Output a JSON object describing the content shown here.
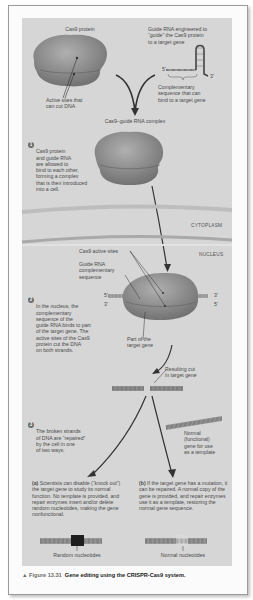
{
  "figure": {
    "number_label": "▲ Figure 13.31",
    "title": "Gene editing using the CRISPR-Cas9 system."
  },
  "top": {
    "cas9_label": "Cas9 protein",
    "active_sites_label": "Active sites that\ncan cut DNA",
    "guide_rna_label": "Guide RNA engineered to\n“guide” the Cas9 protein\nto a target gene",
    "complementary_label": "Complementary\nsequence that can\nbind to a target gene",
    "five_prime": "5'",
    "three_prime": "3'",
    "complex_label": "Cas9–guide RNA complex"
  },
  "steps": [
    {
      "number": "1",
      "text": "Cas9 protein\nand guide RNA\nare allowed to\nbind to each other,\nforming a complex\nthat is then introduced\ninto a cell."
    },
    {
      "number": "2",
      "text": "In the nucleus, the\ncomplementary\nsequence of the\nguide RNA binds to part\nof the target gene. The\nactive sites of the Cas9\nprotein cut the DNA\non both strands."
    },
    {
      "number": "3",
      "text": "The broken strands\nof DNA are “repaired”\nby the cell in one\nof two ways:"
    }
  ],
  "regions": {
    "cytoplasm": "CYTOPLASM",
    "nucleus": "NUCLEUS"
  },
  "nucleus": {
    "active_sites_label": "Cas9 active sites",
    "guide_complementary_label": "Guide RNA\ncomplementary\nsequence",
    "target_part_label": "Part of the\ntarget gene",
    "left_top": "5'",
    "left_bottom": "3'",
    "right_top": "3'",
    "right_bottom": "5'"
  },
  "cut": {
    "resulting_cut_label": "Resulting cut\nin target gene",
    "normal_gene_label": "Normal\n(functional)\ngene for use\nas a template"
  },
  "outcomes": [
    {
      "label": "(a)",
      "text": " Scientists can disable (“knock out”) the target gene to study its normal function. No template is provided, and repair enzymes insert and/or delete random nucleotides, making the gene nonfunctional.",
      "dna_label": "Random nucleotides"
    },
    {
      "label": "(b)",
      "text": " If the target gene has a mutation, it can be repaired. A normal copy of the gene is provided, and repair enzymes use it as a template, restoring the normal gene sequence.",
      "dna_label": "Normal nucleotides"
    }
  ],
  "colors": {
    "panel": "#d6d6d6",
    "protein": "#8c8c8c",
    "membrane": "#b4b4b4",
    "arrow": "#3a3a3a",
    "step_badge": "#6b6b6b"
  }
}
